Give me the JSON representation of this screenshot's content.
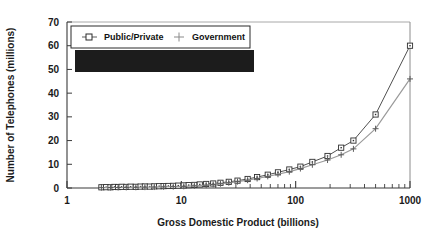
{
  "chart_data": {
    "type": "line",
    "title": "",
    "xlabel": "Gross Domestic Product (billions)",
    "ylabel": "Number of Telephones (millions)",
    "xscale": "log",
    "yscale": "linear",
    "xlim": [
      1,
      1000
    ],
    "ylim": [
      0,
      70
    ],
    "xticks": [
      1,
      10,
      100,
      1000
    ],
    "xtick_labels": [
      "1",
      "10",
      "100",
      "1000"
    ],
    "yticks": [
      0,
      10,
      20,
      30,
      40,
      50,
      60,
      70
    ],
    "ytick_labels": [
      "0",
      "10",
      "20",
      "30",
      "40",
      "50",
      "60",
      "70"
    ],
    "grid": false,
    "legend_position": "top-left",
    "series": [
      {
        "name": "Public/Private",
        "marker": "square",
        "color": "#3c3c3c",
        "points": [
          [
            2.0,
            0.3
          ],
          [
            2.2,
            0.35
          ],
          [
            2.4,
            0.3
          ],
          [
            2.6,
            0.45
          ],
          [
            2.8,
            0.4
          ],
          [
            3.0,
            0.5
          ],
          [
            3.3,
            0.45
          ],
          [
            3.6,
            0.55
          ],
          [
            4.0,
            0.5
          ],
          [
            4.4,
            0.6
          ],
          [
            4.8,
            0.65
          ],
          [
            5.3,
            0.6
          ],
          [
            5.8,
            0.7
          ],
          [
            6.4,
            0.75
          ],
          [
            7.0,
            0.8
          ],
          [
            7.7,
            0.85
          ],
          [
            8.5,
            0.9
          ],
          [
            9.4,
            1.0
          ],
          [
            10.5,
            1.1
          ],
          [
            11.6,
            1.2
          ],
          [
            13.0,
            1.3
          ],
          [
            14.5,
            1.5
          ],
          [
            16.5,
            1.7
          ],
          [
            19.0,
            1.9
          ],
          [
            22.0,
            2.2
          ],
          [
            26.0,
            2.6
          ],
          [
            31.0,
            3.1
          ],
          [
            38.0,
            3.8
          ],
          [
            46.0,
            4.6
          ],
          [
            57.0,
            5.6
          ],
          [
            70.0,
            6.6
          ],
          [
            88.0,
            7.8
          ],
          [
            110.0,
            9.0
          ],
          [
            140.0,
            11.0
          ],
          [
            190.0,
            13.5
          ],
          [
            250.0,
            17.0
          ],
          [
            320.0,
            20.0
          ],
          [
            500.0,
            31.0
          ],
          [
            1000.0,
            60.0
          ]
        ]
      },
      {
        "name": "Government",
        "marker": "plus",
        "color": "#9a9a9a",
        "points": [
          [
            2.0,
            0.15
          ],
          [
            2.4,
            0.2
          ],
          [
            2.8,
            0.22
          ],
          [
            3.3,
            0.25
          ],
          [
            4.0,
            0.3
          ],
          [
            4.8,
            0.35
          ],
          [
            5.8,
            0.4
          ],
          [
            7.0,
            0.48
          ],
          [
            8.5,
            0.55
          ],
          [
            10.5,
            0.7
          ],
          [
            13.0,
            0.9
          ],
          [
            16.5,
            1.2
          ],
          [
            19.0,
            1.5
          ],
          [
            22.0,
            1.8
          ],
          [
            26.0,
            2.2
          ],
          [
            31.0,
            2.7
          ],
          [
            38.0,
            3.3
          ],
          [
            46.0,
            4.0
          ],
          [
            57.0,
            4.9
          ],
          [
            70.0,
            5.8
          ],
          [
            88.0,
            6.9
          ],
          [
            110.0,
            8.2
          ],
          [
            140.0,
            9.8
          ],
          [
            190.0,
            11.8
          ],
          [
            250.0,
            14.0
          ],
          [
            320.0,
            16.5
          ],
          [
            500.0,
            25.0
          ],
          [
            1000.0,
            46.0
          ]
        ]
      }
    ]
  },
  "legend": {
    "entries": [
      {
        "label": "Public/Private",
        "marker": "square"
      },
      {
        "label": "Government",
        "marker": "plus"
      }
    ]
  },
  "axes": {
    "x_title": "Gross Domestic Product (billions)",
    "y_title": "Number of Telephones (millions)"
  }
}
